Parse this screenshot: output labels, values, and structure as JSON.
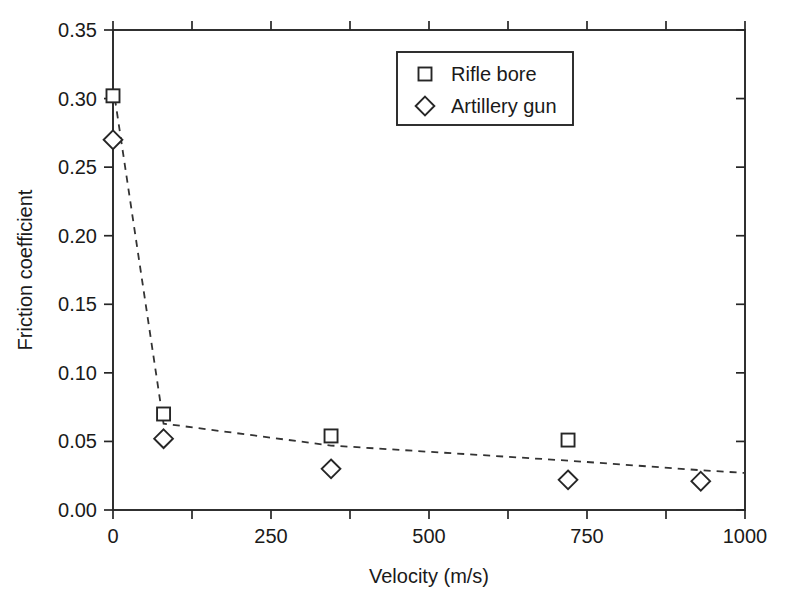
{
  "chart_data": {
    "type": "scatter",
    "title": "",
    "xlabel": "Velocity (m/s)",
    "ylabel": "Friction coefficient",
    "xlim": [
      0,
      1000
    ],
    "ylim": [
      0.0,
      0.35
    ],
    "xticks": [
      "0",
      "250",
      "500",
      "750",
      "1000"
    ],
    "xtick_values": [
      0,
      250,
      500,
      750,
      1000
    ],
    "xminor_values": [
      125,
      375,
      625,
      875
    ],
    "yticks": [
      "0.00",
      "0.05",
      "0.10",
      "0.15",
      "0.20",
      "0.25",
      "0.30",
      "0.35"
    ],
    "ytick_values": [
      0.0,
      0.05,
      0.1,
      0.15,
      0.2,
      0.25,
      0.3,
      0.35
    ],
    "grid": false,
    "legend_position": "top-center",
    "series": [
      {
        "name": "Rifle bore",
        "marker": "square",
        "x": [
          0,
          80,
          345,
          720
        ],
        "y": [
          0.302,
          0.07,
          0.054,
          0.051
        ]
      },
      {
        "name": "Artillery gun",
        "marker": "diamond",
        "x": [
          0,
          80,
          345,
          720,
          930
        ],
        "y": [
          0.27,
          0.052,
          0.03,
          0.022,
          0.021
        ]
      }
    ],
    "trend_line": {
      "style": "dashed",
      "x": [
        3,
        80,
        345,
        720,
        930,
        1000
      ],
      "y": [
        0.3,
        0.063,
        0.047,
        0.036,
        0.029,
        0.027
      ]
    }
  },
  "legend": {
    "entries": [
      {
        "label": "Rifle bore",
        "marker": "square"
      },
      {
        "label": "Artillery gun",
        "marker": "diamond"
      }
    ]
  }
}
